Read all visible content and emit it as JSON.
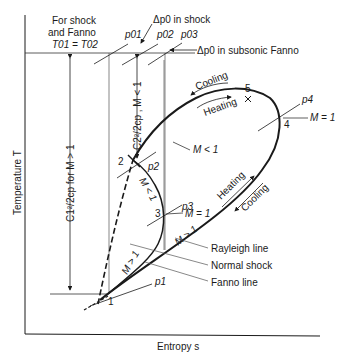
{
  "axes": {
    "x_label": "Entropy s",
    "y_label": "Temperature T"
  },
  "header_note": {
    "line1": "For shock",
    "line2": "and Fanno",
    "line3": "T01 = T02"
  },
  "isobars": {
    "p01": "p01",
    "p02": "p02",
    "p03": "p03",
    "p1": "p1",
    "p2": "p2",
    "p3": "p3",
    "p4": "p4"
  },
  "annotations": {
    "dp0_shock": "Δp0 in shock",
    "dp0_fanno": "Δp0 in subsonic Fanno",
    "c2_label": "C2²/2cp , M < 1",
    "c1_label": "C1²/2cp for M > 1"
  },
  "points": {
    "p1": "1",
    "p2": "2",
    "p3": "3",
    "p4": "4",
    "p5": "5"
  },
  "curve_labels": {
    "rayleigh": "Rayleigh line",
    "normal_shock": "Normal shock",
    "fanno": "Fanno line",
    "m_lt_1_upper": "M < 1",
    "m_eq_1_right": "M = 1",
    "m_eq_1_fanno": "M = 1",
    "m_lt_1_fanno": "M < 1",
    "m_gt_1_fanno": "M > 1",
    "m_gt_1_rayleigh": "M > 1"
  },
  "process_labels": {
    "cooling_top": "Cooling",
    "heating_top": "Heating",
    "heating_bottom": "Heating",
    "cooling_bottom": "Cooling"
  }
}
